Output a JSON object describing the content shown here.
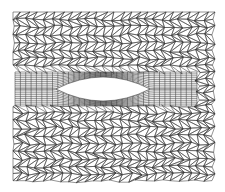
{
  "figure": {
    "type": "finite-element mesh",
    "colors": {
      "background": "#ffffff",
      "edge": "#333333",
      "hole": "#ffffff"
    },
    "domain_box": {
      "x0": 13,
      "y0": 12,
      "x1": 215,
      "y1": 183
    },
    "hole": {
      "left_tip": [
        56,
        89
      ],
      "right_tip": [
        150,
        89
      ],
      "top": 77,
      "bottom": 101
    },
    "band": {
      "x0": 15,
      "x1": 197,
      "y0": 72,
      "y1": 106
    },
    "tri_spacing": 8.5
  }
}
